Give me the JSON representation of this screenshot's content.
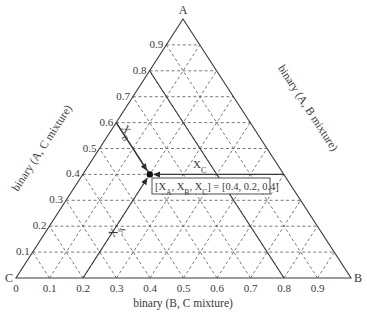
{
  "chart_data": {
    "type": "ternary",
    "title": "",
    "vertices": {
      "top": "A",
      "right": "B",
      "left": "C"
    },
    "axis_labels": {
      "left_edge": "binary (A, C mixture)",
      "right_edge": "binary (A, B mixture)",
      "bottom_edge": "binary (B, C mixture)"
    },
    "left_ticks": [
      "0.1",
      "0.2",
      "0.3",
      "0.4",
      "0.5",
      "0.6",
      "0.7",
      "0.8",
      "0.9"
    ],
    "bottom_ticks": [
      "0",
      "0.1",
      "0.2",
      "0.3",
      "0.4",
      "0.5",
      "0.6",
      "0.7",
      "0.8",
      "0.9"
    ],
    "grid": {
      "on": true,
      "step": 0.1,
      "style": "dashed"
    },
    "point": {
      "X_A": 0.4,
      "X_B": 0.2,
      "X_C": 0.4
    },
    "construction_lines": [
      {
        "label": "X_A",
        "from_bottom_tick": 0.2
      },
      {
        "label": "X_B",
        "from_left_tick": 0.6
      },
      {
        "label": "X_C",
        "from_right_edge_at_A": 0.4
      }
    ],
    "annotation": "[X_A, X_B, X_C] = [0.4, 0.2, 0.4]"
  },
  "labels": {
    "vertex_a": "A",
    "vertex_b": "B",
    "vertex_c": "C",
    "left_axis": "binary (A, C mixture)",
    "right_axis": "binary (A, B mixture)",
    "bottom_axis": "binary (B, C mixture)",
    "xa_main": "X",
    "xa_sub": "A",
    "xb_main": "X",
    "xb_sub": "B",
    "xc_main": "X",
    "xc_sub": "C",
    "annot_open": "[X",
    "annot_sub_a": "A",
    "annot_comma1": ", X",
    "annot_sub_b": "B",
    "annot_comma2": ", X",
    "annot_sub_c": "C",
    "annot_value": "] = [0.4, 0.2, 0.4]"
  }
}
